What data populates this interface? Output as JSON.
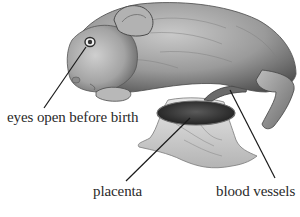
{
  "figure": {
    "labels": {
      "eyes": "eyes open before birth",
      "placenta": "placenta",
      "vessels": "blood vessels"
    }
  },
  "colors": {
    "background": "#ffffff",
    "fur_light": "#b9b9b9",
    "fur_dark": "#5a5a5a",
    "placenta": "#2e2e2e",
    "membrane": "#d4d4d4",
    "leader_line": "#1a1a1a",
    "text": "#2a2a2a"
  }
}
